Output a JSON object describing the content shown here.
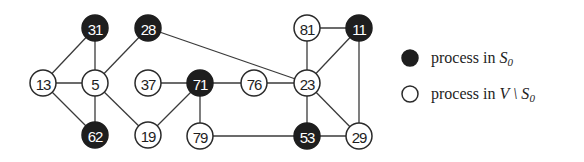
{
  "diagram": {
    "type": "graph",
    "node_radius": 13,
    "colors": {
      "s0_fill": "#1e1e1e",
      "s0_hatch": "#8a8a8a",
      "other_fill": "#ffffff",
      "stroke": "#2a2a2a",
      "edge": "#3a3a3a"
    },
    "nodes": [
      {
        "id": "31",
        "label": "31",
        "x": 95,
        "y": 28,
        "group": "S0"
      },
      {
        "id": "28",
        "label": "28",
        "x": 148,
        "y": 28,
        "group": "S0"
      },
      {
        "id": "81",
        "label": "81",
        "x": 307,
        "y": 28,
        "group": "V\\S0"
      },
      {
        "id": "11",
        "label": "11",
        "x": 359,
        "y": 28,
        "group": "S0"
      },
      {
        "id": "13",
        "label": "13",
        "x": 43,
        "y": 83,
        "group": "V\\S0"
      },
      {
        "id": "5",
        "label": "5",
        "x": 95,
        "y": 83,
        "group": "V\\S0"
      },
      {
        "id": "37",
        "label": "37",
        "x": 148,
        "y": 83,
        "group": "V\\S0"
      },
      {
        "id": "71",
        "label": "71",
        "x": 200,
        "y": 83,
        "group": "S0"
      },
      {
        "id": "76",
        "label": "76",
        "x": 254,
        "y": 83,
        "group": "V\\S0"
      },
      {
        "id": "23",
        "label": "23",
        "x": 307,
        "y": 83,
        "group": "V\\S0"
      },
      {
        "id": "62",
        "label": "62",
        "x": 95,
        "y": 135,
        "group": "S0"
      },
      {
        "id": "19",
        "label": "19",
        "x": 148,
        "y": 135,
        "group": "V\\S0"
      },
      {
        "id": "79",
        "label": "79",
        "x": 200,
        "y": 136,
        "group": "V\\S0"
      },
      {
        "id": "53",
        "label": "53",
        "x": 307,
        "y": 136,
        "group": "S0"
      },
      {
        "id": "29",
        "label": "29",
        "x": 359,
        "y": 136,
        "group": "V\\S0"
      }
    ],
    "edges": [
      [
        "31",
        "13"
      ],
      [
        "31",
        "5"
      ],
      [
        "13",
        "5"
      ],
      [
        "13",
        "62"
      ],
      [
        "5",
        "62"
      ],
      [
        "5",
        "28"
      ],
      [
        "5",
        "19"
      ],
      [
        "28",
        "23"
      ],
      [
        "37",
        "71"
      ],
      [
        "71",
        "76"
      ],
      [
        "71",
        "19"
      ],
      [
        "71",
        "79"
      ],
      [
        "76",
        "23"
      ],
      [
        "81",
        "11"
      ],
      [
        "81",
        "23"
      ],
      [
        "11",
        "23"
      ],
      [
        "11",
        "29"
      ],
      [
        "23",
        "53"
      ],
      [
        "23",
        "29"
      ],
      [
        "79",
        "53"
      ],
      [
        "53",
        "29"
      ]
    ]
  },
  "legend": {
    "items": [
      {
        "marker": "S0",
        "text_prefix": "process in ",
        "math_main": "S",
        "math_sub": "0",
        "x": 410,
        "y": 58
      },
      {
        "marker": "V\\S0",
        "text_prefix": "process in ",
        "math_main": "V \\ S",
        "math_sub": "0",
        "x": 410,
        "y": 94
      }
    ]
  }
}
